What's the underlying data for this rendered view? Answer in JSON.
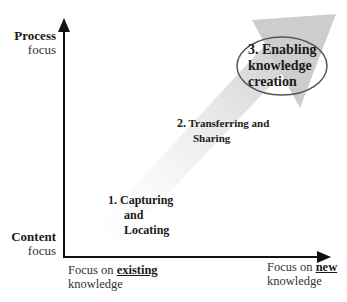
{
  "diagram": {
    "y_axis": {
      "top_label": {
        "title": "Process",
        "subtitle": "focus"
      },
      "bottom_label": {
        "title": "Content",
        "subtitle": "focus"
      }
    },
    "x_axis": {
      "left_label": {
        "prefix": "Focus on ",
        "emphasis": "existing",
        "suffix": "knowledge"
      },
      "right_label": {
        "prefix": "Focus on ",
        "emphasis": "new",
        "suffix": "knowledge"
      }
    },
    "stages": [
      {
        "number": "1.",
        "lines": [
          "Capturing",
          "and",
          "Locating"
        ]
      },
      {
        "number": "2.",
        "lines": [
          "Transferring and",
          "Sharing"
        ]
      },
      {
        "number": "3.",
        "lines": [
          "Enabling",
          "knowledge",
          "creation"
        ],
        "highlighted": true
      }
    ],
    "colors": {
      "axis": "#111111",
      "trend_arrow": "#c8c8c8",
      "ellipse_stroke": "#555555"
    }
  }
}
